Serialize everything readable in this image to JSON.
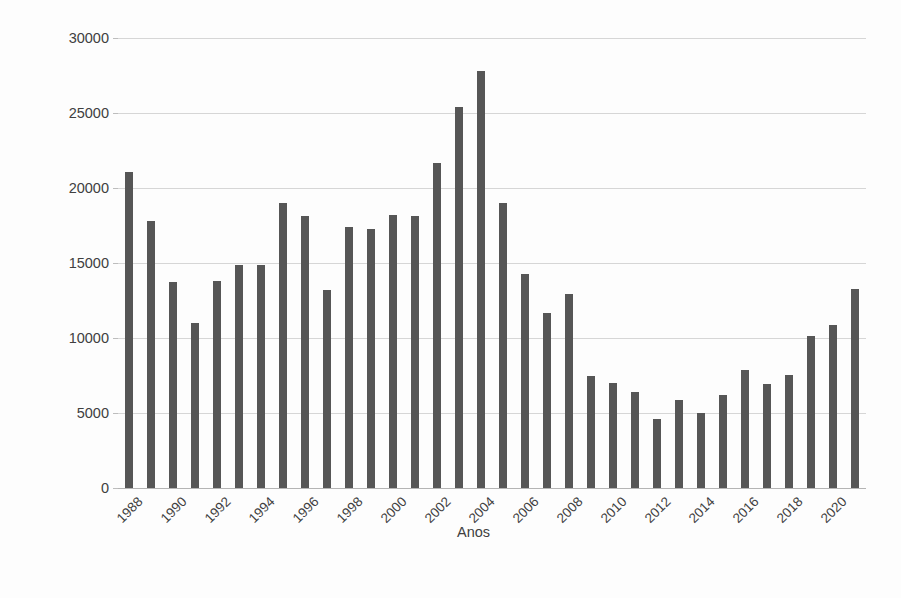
{
  "chart_data": {
    "type": "bar",
    "title": "",
    "xlabel": "Anos",
    "ylabel": "Taxa de desmatamento (km2)",
    "ylim": [
      0,
      30000
    ],
    "ytick_labels": [
      "0",
      "5000",
      "10000",
      "15000",
      "20000",
      "25000",
      "30000"
    ],
    "ytick_values": [
      0,
      5000,
      10000,
      15000,
      20000,
      25000,
      30000
    ],
    "grid": true,
    "legend": false,
    "bar_color": "#565656",
    "categories": [
      "1988",
      "1989",
      "1990",
      "1991",
      "1992",
      "1993",
      "1994",
      "1995",
      "1996",
      "1997",
      "1998",
      "1999",
      "2000",
      "2001",
      "2002",
      "2003",
      "2004",
      "2005",
      "2006",
      "2007",
      "2008",
      "2009",
      "2010",
      "2011",
      "2012",
      "2013",
      "2014",
      "2015",
      "2016",
      "2017",
      "2018",
      "2019",
      "2020",
      "2021"
    ],
    "xtick_labels_shown": [
      "1988",
      "1990",
      "1992",
      "1994",
      "1996",
      "1998",
      "2000",
      "2002",
      "2004",
      "2006",
      "2008",
      "2010",
      "2012",
      "2014",
      "2016",
      "2018",
      "2020"
    ],
    "values": [
      21050,
      17770,
      13730,
      11030,
      13786,
      14896,
      14896,
      19014,
      18161,
      13227,
      17383,
      17259,
      18226,
      18165,
      21651,
      25396,
      27772,
      19014,
      14286,
      11651,
      12911,
      7464,
      7000,
      6418,
      4571,
      5891,
      5012,
      6207,
      7893,
      6947,
      7536,
      10129,
      10851,
      13235
    ]
  }
}
